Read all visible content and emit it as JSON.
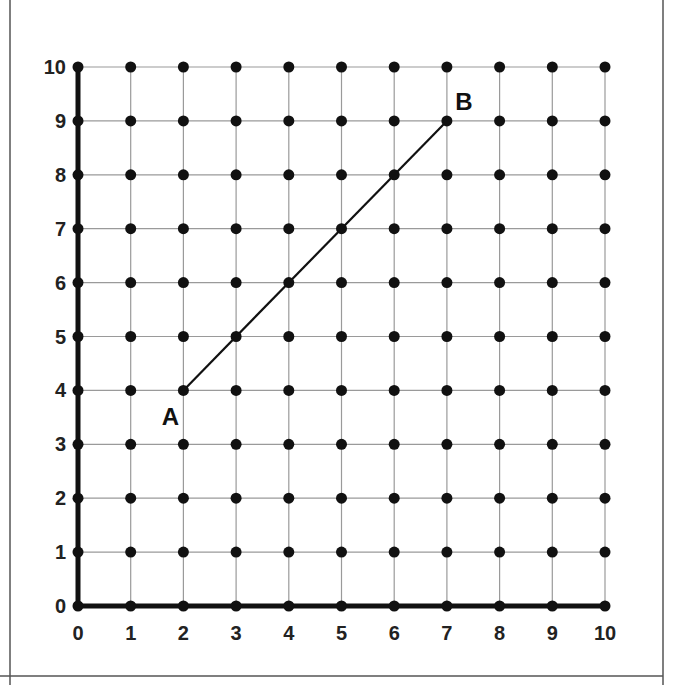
{
  "grid": {
    "x_min": 0,
    "x_max": 10,
    "y_min": 0,
    "y_max": 10,
    "x_ticks": [
      "0",
      "1",
      "2",
      "3",
      "4",
      "5",
      "6",
      "7",
      "8",
      "9",
      "10"
    ],
    "y_ticks": [
      "0",
      "1",
      "2",
      "3",
      "4",
      "5",
      "6",
      "7",
      "8",
      "9",
      "10"
    ],
    "dots_at_every_integer_point": true
  },
  "segment": {
    "start": {
      "label": "A",
      "x": 2,
      "y": 4
    },
    "end": {
      "label": "B",
      "x": 7,
      "y": 9
    }
  },
  "colors": {
    "ink": "#111111",
    "grid": "#9a9a9a",
    "border": "#555555"
  }
}
